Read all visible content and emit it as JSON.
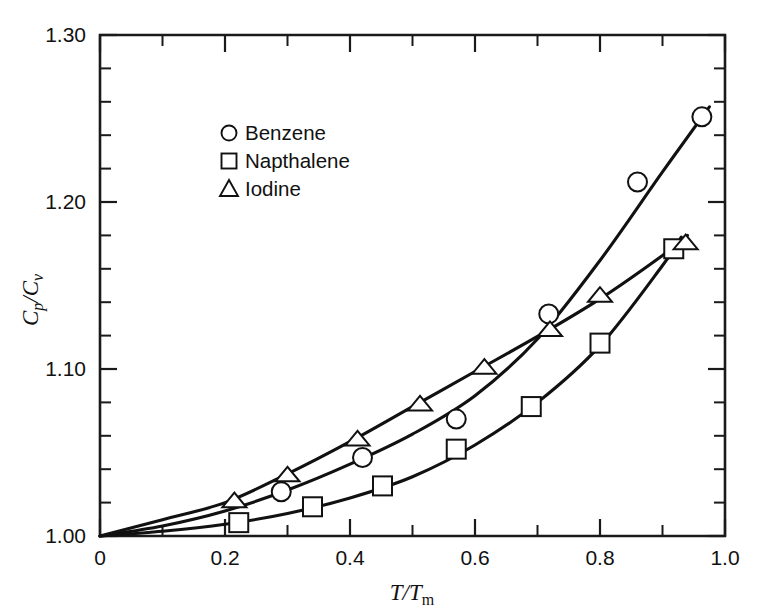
{
  "chart_data": {
    "type": "scatter",
    "title": "",
    "subtitle": "",
    "xlabel": "T/Tm",
    "ylabel": "Cp/Cv",
    "xlim": [
      0,
      1.0
    ],
    "ylim": [
      1.0,
      1.3
    ],
    "grid": false,
    "legend_position": "upper-left-inside",
    "x_ticks_major": [
      "0",
      "0.2",
      "0.4",
      "0.6",
      "0.8",
      "1.0"
    ],
    "x_tick_values": [
      0,
      0.2,
      0.4,
      0.6,
      0.8,
      1.0
    ],
    "x_minor_step": 0.1,
    "y_ticks_major": [
      "1.00",
      "1.10",
      "1.20",
      "1.30"
    ],
    "y_tick_values": [
      1.0,
      1.1,
      1.2,
      1.3
    ],
    "y_minor_step": 0.02,
    "series": [
      {
        "name": "Benzene",
        "marker": "circle",
        "color": "#111111",
        "points": [
          [
            0.29,
            1.0265
          ],
          [
            0.42,
            1.047
          ],
          [
            0.57,
            1.07
          ],
          [
            0.718,
            1.133
          ],
          [
            0.86,
            1.212
          ],
          [
            0.963,
            1.251
          ]
        ],
        "curve": [
          [
            0.0,
            1.0
          ],
          [
            0.1,
            1.006
          ],
          [
            0.2,
            1.015
          ],
          [
            0.3,
            1.0275
          ],
          [
            0.4,
            1.043
          ],
          [
            0.5,
            1.061
          ],
          [
            0.6,
            1.084
          ],
          [
            0.7,
            1.118
          ],
          [
            0.8,
            1.165
          ],
          [
            0.9,
            1.218
          ],
          [
            0.975,
            1.257
          ]
        ]
      },
      {
        "name": "Napthalene",
        "marker": "square",
        "color": "#111111",
        "points": [
          [
            0.222,
            1.008
          ],
          [
            0.34,
            1.0175
          ],
          [
            0.452,
            1.03
          ],
          [
            0.57,
            1.052
          ],
          [
            0.69,
            1.0775
          ],
          [
            0.8,
            1.1155
          ],
          [
            0.918,
            1.172
          ]
        ],
        "curve": [
          [
            0.0,
            1.0
          ],
          [
            0.1,
            1.0028
          ],
          [
            0.2,
            1.007
          ],
          [
            0.3,
            1.0135
          ],
          [
            0.4,
            1.0228
          ],
          [
            0.5,
            1.0355
          ],
          [
            0.6,
            1.0545
          ],
          [
            0.7,
            1.08
          ],
          [
            0.8,
            1.114
          ],
          [
            0.9,
            1.162
          ],
          [
            0.93,
            1.179
          ]
        ]
      },
      {
        "name": "Iodine",
        "marker": "triangle",
        "color": "#111111",
        "points": [
          [
            0.215,
            1.021
          ],
          [
            0.3,
            1.0365
          ],
          [
            0.412,
            1.058
          ],
          [
            0.512,
            1.079
          ],
          [
            0.615,
            1.101
          ],
          [
            0.72,
            1.1235
          ],
          [
            0.8,
            1.144
          ],
          [
            0.937,
            1.1755
          ]
        ],
        "curve": [
          [
            0.0,
            1.0
          ],
          [
            0.1,
            1.0098
          ],
          [
            0.2,
            1.02
          ],
          [
            0.3,
            1.0372
          ],
          [
            0.4,
            1.0565
          ],
          [
            0.5,
            1.0775
          ],
          [
            0.6,
            1.0985
          ],
          [
            0.7,
            1.1195
          ],
          [
            0.8,
            1.142
          ],
          [
            0.9,
            1.168
          ],
          [
            0.94,
            1.18
          ]
        ]
      }
    ]
  },
  "axes": {
    "y_label_main": "C",
    "y_label_sub1": "p",
    "y_label_slash": "/C",
    "y_label_sub2": "v",
    "x_label_main": "T",
    "x_label_slash": "/T",
    "x_label_sub": "m"
  },
  "legend": {
    "items": [
      {
        "marker": "circle-marker",
        "label": "Benzene"
      },
      {
        "marker": "square-marker",
        "label": "Napthalene"
      },
      {
        "marker": "triangle-marker",
        "label": "Iodine"
      }
    ]
  }
}
